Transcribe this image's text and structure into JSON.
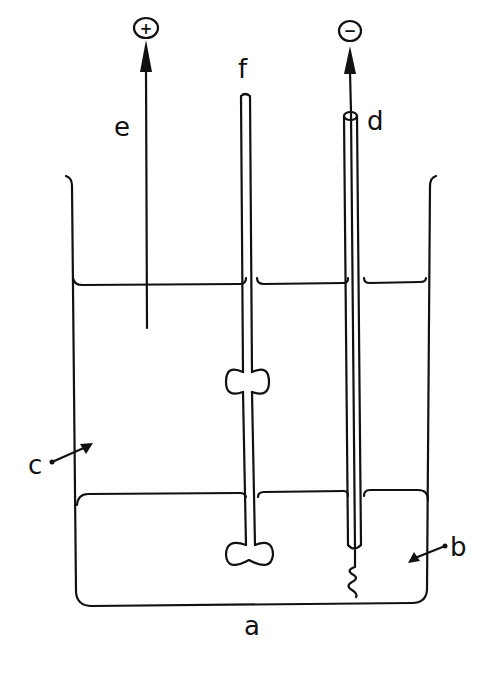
{
  "diagram": {
    "colors": {
      "stroke": "#111111",
      "background": "#ffffff"
    },
    "labels": {
      "a": "a",
      "b": "b",
      "c": "c",
      "d": "d",
      "e": "e",
      "f": "f"
    },
    "terminals": {
      "positive": "+",
      "negative": "−"
    },
    "components": [
      {
        "id": "a",
        "name": "beaker"
      },
      {
        "id": "b",
        "name": "lower liquid layer"
      },
      {
        "id": "c",
        "name": "upper liquid layer"
      },
      {
        "id": "d",
        "name": "cathode tube (negative)"
      },
      {
        "id": "e",
        "name": "anode wire (positive)"
      },
      {
        "id": "f",
        "name": "stirrer"
      }
    ]
  }
}
